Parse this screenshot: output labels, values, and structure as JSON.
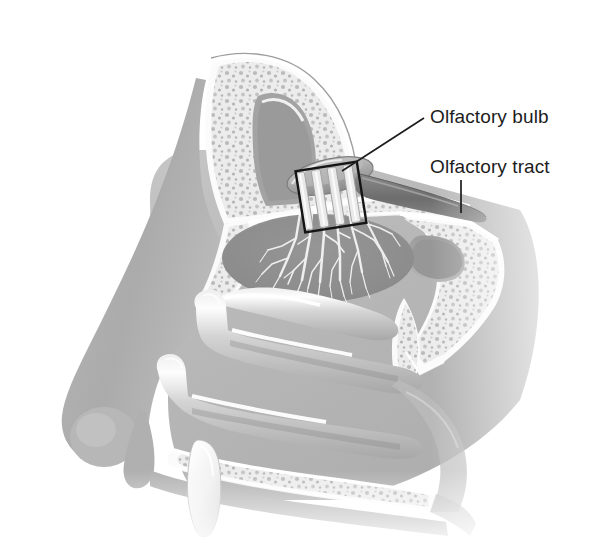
{
  "figure": {
    "type": "anatomical-illustration",
    "style": "grayscale-medical-line-and-tone",
    "background_color": "#ffffff",
    "width": 601,
    "height": 552
  },
  "labels": [
    {
      "id": "olfactory-bulb",
      "text": "Olfactory bulb",
      "x": 430,
      "y": 106,
      "color": "#1d1d1d",
      "leader": {
        "type": "diagonal-line",
        "from_x": 342,
        "from_y": 171,
        "to_x": 424,
        "to_y": 118
      }
    },
    {
      "id": "olfactory-tract",
      "text": "Olfactory tract",
      "x": 430,
      "y": 156,
      "color": "#1d1d1d",
      "leader": {
        "type": "vertical-line",
        "from_x": 461,
        "from_y": 213,
        "to_x": 461,
        "to_y": 180
      }
    }
  ],
  "structures": [
    {
      "id": "frontal-sinus",
      "name": "Frontal sinus",
      "description": "Air-filled cavity in frontal bone, upper left"
    },
    {
      "id": "cancellous-bone",
      "name": "Cancellous bone",
      "description": "Mottled spongy bone surrounding sinuses"
    },
    {
      "id": "cribriform-plate",
      "name": "Cribriform plate",
      "description": "Perforated bone shelf beneath olfactory bulb"
    },
    {
      "id": "olfactory-bulb-shape",
      "name": "Olfactory bulb",
      "description": "Elongated oval structure above cribriform plate"
    },
    {
      "id": "olfactory-tract-shape",
      "name": "Olfactory tract",
      "description": "Dark band extending posteriorly from bulb"
    },
    {
      "id": "olfactory-nerve-fibers",
      "name": "Olfactory nerve filaments",
      "description": "Vertical bundles crossing cribriform plate"
    },
    {
      "id": "olfactory-epithelium",
      "name": "Olfactory epithelium",
      "description": "Darker oval region with white dendritic nerve branching"
    },
    {
      "id": "superior-concha",
      "name": "Superior nasal concha",
      "description": "Upper turbinate shelf"
    },
    {
      "id": "middle-concha",
      "name": "Middle nasal concha",
      "description": "Middle turbinate with specular highlight"
    },
    {
      "id": "inferior-concha",
      "name": "Inferior nasal concha",
      "description": "Lower turbinate with specular highlight"
    },
    {
      "id": "nasal-bone",
      "name": "Nasal bone",
      "description": "Tapering bone along nasal dorsum"
    },
    {
      "id": "nasal-dorsum",
      "name": "Nasal dorsum and tip",
      "description": "Soft tissue external nose profile"
    },
    {
      "id": "hard-palate",
      "name": "Hard palate",
      "description": "Bony floor of nasal cavity"
    },
    {
      "id": "incisor-tooth",
      "name": "Incisor tooth",
      "description": "White conical tooth below hard palate"
    },
    {
      "id": "sphenoid-sinus",
      "name": "Sphenoid sinus",
      "description": "Posterior air cavity"
    },
    {
      "id": "nasopharynx",
      "name": "Nasopharynx",
      "description": "Posterior airway region"
    },
    {
      "id": "box-outline",
      "name": "Detail box",
      "description": "Black rectangular outline around bulb and cribriform region"
    }
  ],
  "palette": {
    "background": "#ffffff",
    "bone_light": "#f2f2f2",
    "bone_mid": "#d8d8d8",
    "soft_tissue_light": "#c9c9c9",
    "soft_tissue_mid": "#b4b4b4",
    "soft_tissue_dark": "#9a9a9a",
    "cavity_dark": "#8e8e8e",
    "tract_dark": "#6f6f6f",
    "outline": "#2a2a2a",
    "highlight": "#ffffff",
    "label_text": "#1d1d1d"
  }
}
